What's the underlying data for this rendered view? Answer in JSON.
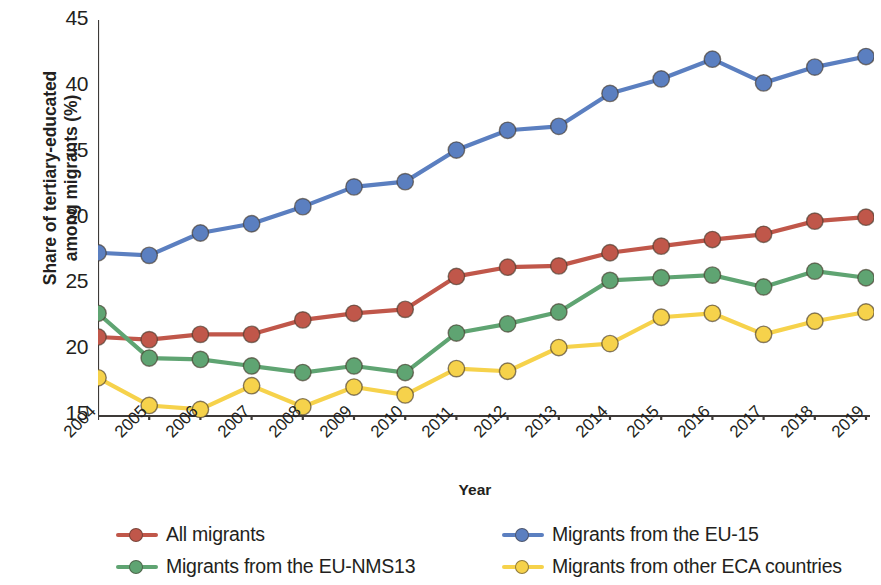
{
  "chart_data": {
    "type": "line",
    "title": "",
    "xlabel": "Year",
    "ylabel": "Share of tertiary-educated among migrants (%)",
    "ylabel_line1": "Share of tertiary-educated",
    "ylabel_line2": "among migrants (%)",
    "categories": [
      "2004",
      "2005",
      "2006",
      "2007",
      "2008",
      "2009",
      "2010",
      "2011",
      "2012",
      "2013",
      "2014",
      "2015",
      "2016",
      "2017",
      "2018",
      "2019"
    ],
    "x": [
      2004,
      2005,
      2006,
      2007,
      2008,
      2009,
      2010,
      2011,
      2012,
      2013,
      2014,
      2015,
      2016,
      2017,
      2018,
      2019
    ],
    "ylim": [
      15,
      45
    ],
    "yticks": [
      15,
      20,
      25,
      30,
      35,
      40,
      45
    ],
    "ytick_labels": [
      "15",
      "20",
      "25",
      "30",
      "35",
      "40",
      "45"
    ],
    "grid": false,
    "legend_position": "bottom",
    "series": [
      {
        "name": "All migrants",
        "color": "#C0574A",
        "values": [
          21.0,
          20.8,
          21.2,
          21.2,
          22.3,
          22.8,
          23.1,
          25.6,
          26.3,
          26.4,
          27.4,
          27.9,
          28.4,
          28.8,
          29.8,
          30.1
        ]
      },
      {
        "name": "Migrants from the EU-15",
        "color": "#5B7FC0",
        "values": [
          27.4,
          27.2,
          28.9,
          29.6,
          30.9,
          32.4,
          32.8,
          35.2,
          36.7,
          37.0,
          39.5,
          40.6,
          42.1,
          40.3,
          41.5,
          42.3
        ]
      },
      {
        "name": "Migrants from the EU-NMS13",
        "color": "#5FA472",
        "values": [
          22.8,
          19.4,
          19.3,
          18.8,
          18.3,
          18.8,
          18.3,
          21.3,
          22.0,
          22.9,
          25.3,
          25.5,
          25.7,
          24.8,
          26.0,
          25.5
        ]
      },
      {
        "name": "Migrants from other ECA countries",
        "color": "#F6D24B",
        "values": [
          17.9,
          15.8,
          15.5,
          17.3,
          15.7,
          17.2,
          16.6,
          18.6,
          18.4,
          20.2,
          20.5,
          22.5,
          22.8,
          21.2,
          22.2,
          22.9
        ]
      }
    ]
  },
  "axis": {
    "x_title": "Year",
    "y_title_line1": "Share of tertiary-educated",
    "y_title_line2": "among migrants (%)"
  },
  "legend": {
    "items": [
      {
        "label": "All migrants",
        "color": "#C0574A"
      },
      {
        "label": "Migrants from the EU-15",
        "color": "#5B7FC0"
      },
      {
        "label": "Migrants from the EU-NMS13",
        "color": "#5FA472"
      },
      {
        "label": "Migrants from other ECA countries",
        "color": "#F6D24B"
      }
    ]
  },
  "colors": {
    "all_migrants": "#C0574A",
    "eu15": "#5B7FC0",
    "eu_nms13": "#5FA472",
    "other_eca": "#F6D24B",
    "axis": "#3d3a38",
    "text": "#231f20"
  }
}
